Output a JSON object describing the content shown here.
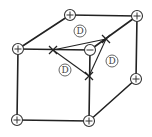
{
  "diagram": {
    "title": "",
    "type": "cubic-lattice-defect",
    "vertices": [
      {
        "id": "top-back-left",
        "x": 70,
        "y": 15,
        "charge": "+"
      },
      {
        "id": "top-back-right",
        "x": 137,
        "y": 16,
        "charge": "+"
      },
      {
        "id": "top-front-left",
        "x": 18,
        "y": 49,
        "charge": "+"
      },
      {
        "id": "center-minus",
        "x": 90,
        "y": 50,
        "charge": "-"
      },
      {
        "id": "bottom-front-left",
        "x": 17,
        "y": 120,
        "charge": "+"
      },
      {
        "id": "bottom-front-right",
        "x": 89,
        "y": 121,
        "charge": "+"
      },
      {
        "id": "mid-back-right",
        "x": 136,
        "y": 79,
        "charge": "+"
      }
    ],
    "cross_marks": [
      {
        "id": "cross-left",
        "x": 53,
        "y": 50
      },
      {
        "id": "cross-upper-right",
        "x": 106,
        "y": 39
      },
      {
        "id": "cross-lower",
        "x": 89,
        "y": 76
      }
    ],
    "labels": [
      {
        "id": "label-d-top",
        "text": "D",
        "x": 80,
        "y": 31
      },
      {
        "id": "label-d-left",
        "text": "D",
        "x": 65,
        "y": 70
      },
      {
        "id": "label-d-right",
        "text": "D",
        "x": 112,
        "y": 61
      }
    ],
    "colors": {
      "line": "#222222",
      "background": "#ffffff"
    }
  }
}
